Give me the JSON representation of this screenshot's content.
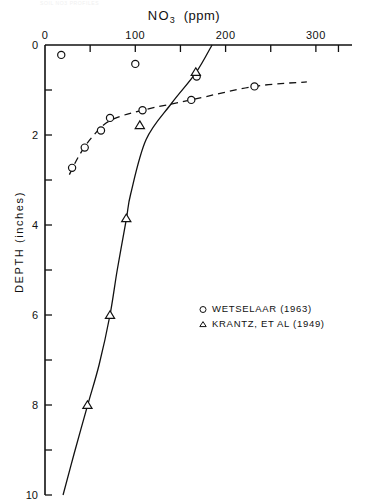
{
  "page": {
    "faint_header_text": "SOIL  NO3  PROFILES"
  },
  "chart_data": {
    "type": "scatter",
    "title_main": "NO",
    "title_sub": "3",
    "title_unit": "(ppm)",
    "xlabel": "NO3 (ppm)",
    "ylabel": "DEPTH  (inches)",
    "xlim": [
      0,
      340
    ],
    "ylim": [
      0,
      10
    ],
    "y_inverted": true,
    "grid": false,
    "x_ticks_major": [
      0,
      100,
      200,
      300
    ],
    "x_tick_labels": [
      "0",
      "100",
      "200",
      "300"
    ],
    "x_ticks_minor": [
      50,
      150,
      250,
      325
    ],
    "y_ticks_major": [
      0,
      2,
      4,
      6,
      8,
      10
    ],
    "y_tick_labels": [
      "0",
      "2",
      "4",
      "6",
      "8",
      "10"
    ],
    "y_ticks_minor": [
      1,
      3,
      5,
      7,
      9
    ],
    "legend_position": "center-right",
    "series": [
      {
        "name": "WETSELAAR  (1963)",
        "marker": "circle",
        "line": "dashed",
        "points": [
          {
            "x": 18,
            "y": 0.22
          },
          {
            "x": 100,
            "y": 0.42
          },
          {
            "x": 168,
            "y": 0.7
          },
          {
            "x": 30,
            "y": 2.73
          },
          {
            "x": 44,
            "y": 2.28
          },
          {
            "x": 62,
            "y": 1.9
          },
          {
            "x": 72,
            "y": 1.62
          },
          {
            "x": 108,
            "y": 1.45
          },
          {
            "x": 162,
            "y": 1.22
          },
          {
            "x": 232,
            "y": 0.92
          }
        ],
        "curve_points": [
          {
            "x": 27,
            "y": 2.88
          },
          {
            "x": 38,
            "y": 2.45
          },
          {
            "x": 52,
            "y": 2.05
          },
          {
            "x": 72,
            "y": 1.68
          },
          {
            "x": 108,
            "y": 1.45
          },
          {
            "x": 162,
            "y": 1.22
          },
          {
            "x": 232,
            "y": 0.92
          },
          {
            "x": 290,
            "y": 0.82
          }
        ]
      },
      {
        "name": "KRANTZ, ET AL (1949)",
        "marker": "triangle",
        "line": "solid",
        "points": [
          {
            "x": 167,
            "y": 0.6
          },
          {
            "x": 105,
            "y": 1.78
          },
          {
            "x": 90,
            "y": 3.85
          },
          {
            "x": 72,
            "y": 6.0
          },
          {
            "x": 47,
            "y": 8.0
          }
        ],
        "curve_points": [
          {
            "x": 185,
            "y": 0.0
          },
          {
            "x": 167,
            "y": 0.62
          },
          {
            "x": 140,
            "y": 1.3
          },
          {
            "x": 112,
            "y": 2.1
          },
          {
            "x": 95,
            "y": 3.3
          },
          {
            "x": 90,
            "y": 3.88
          },
          {
            "x": 80,
            "y": 5.0
          },
          {
            "x": 72,
            "y": 6.0
          },
          {
            "x": 60,
            "y": 7.1
          },
          {
            "x": 47,
            "y": 8.02
          },
          {
            "x": 32,
            "y": 9.1
          },
          {
            "x": 20,
            "y": 10.0
          }
        ]
      }
    ]
  },
  "legend": {
    "items": [
      {
        "marker": "circle-marker",
        "label": "WETSELAAR  (1963)"
      },
      {
        "marker": "triangle-marker",
        "label": "KRANTZ, ET AL (1949)"
      }
    ]
  }
}
